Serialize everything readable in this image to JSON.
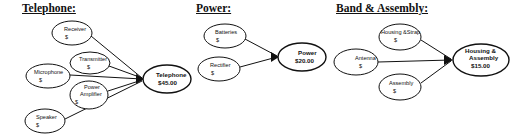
{
  "sections": [
    {
      "id": "telephone",
      "title": "Telephone:",
      "inputs": [
        {
          "label": "Receiver",
          "value": "$"
        },
        {
          "label": "Transmitter",
          "value": "$"
        },
        {
          "label": "Microphone",
          "value": "$"
        },
        {
          "label": "Power Amplifier",
          "line1": "Power",
          "line2": "Amplifier",
          "value": "$"
        },
        {
          "label": "Speaker",
          "value": "$"
        }
      ],
      "output": {
        "label": "Telephone",
        "value": "$45.00"
      }
    },
    {
      "id": "power",
      "title": "Power:",
      "inputs": [
        {
          "label": "Batteries",
          "value": "$"
        },
        {
          "label": "Rectifier",
          "value": "$"
        }
      ],
      "output": {
        "label": "Power",
        "value": "$20.00"
      }
    },
    {
      "id": "band-assembly",
      "title": "Band & Assembly:",
      "inputs": [
        {
          "label": "Housing &Strap",
          "value": "$"
        },
        {
          "label": "Antenna",
          "value": "$"
        },
        {
          "label": "Assembly",
          "value": "$"
        }
      ],
      "output": {
        "label": "Housing & Assembly",
        "line1": "Housing &",
        "line2": "Assembly",
        "value": "$15.00"
      }
    }
  ]
}
